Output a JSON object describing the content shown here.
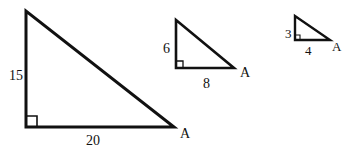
{
  "diagram": {
    "stroke_color": "#111111",
    "background": "#ffffff",
    "triangles": [
      {
        "name": "large",
        "vertical_leg": "15",
        "horizontal_leg": "20",
        "vertex_label": "A"
      },
      {
        "name": "medium",
        "vertical_leg": "6",
        "horizontal_leg": "8",
        "vertex_label": "A"
      },
      {
        "name": "small",
        "vertical_leg": "3",
        "horizontal_leg": "4",
        "vertex_label": "A"
      }
    ]
  }
}
